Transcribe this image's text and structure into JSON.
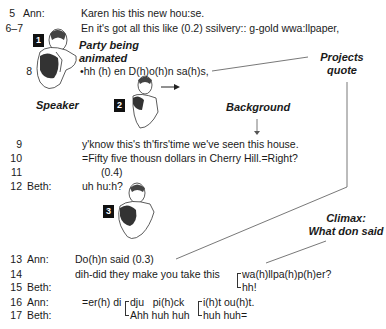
{
  "transcript": {
    "lines": [
      {
        "num": "5",
        "speaker": "Ann:",
        "text": "Karen his this new hou:se."
      },
      {
        "num": "6–7",
        "speaker": "",
        "text": "En it's got all this like (0.2) ssilvery:: g-gold wwa:llpaper,"
      },
      {
        "num": "8",
        "speaker": "",
        "text": "•hh (h) en D(h)o(h)n sa(h)s,"
      },
      {
        "num": "9",
        "speaker": "",
        "text": "y'know this's th'firs'time we've seen this house."
      },
      {
        "num": "10",
        "speaker": "",
        "text": "=Fifty five thousn dollars in Cherry Hill.=Right?"
      },
      {
        "num": "11",
        "speaker": "",
        "text": "(0.4)"
      },
      {
        "num": "12",
        "speaker": "Beth:",
        "text": "uh hu:h?"
      },
      {
        "num": "13",
        "speaker": "Ann:",
        "text": "Do(h)n said (0.3)"
      },
      {
        "num": "14",
        "speaker": "",
        "text": "dih-did they make you take this",
        "overlap": "wa(h)llpa(h)p(h)er?"
      },
      {
        "num": "15",
        "speaker": "Beth:",
        "text": "",
        "overlap": "hh!"
      },
      {
        "num": "16",
        "speaker": "Ann:",
        "text": "=er(h) di",
        "overlap1": "dju   pi(h)ck",
        "overlap2": "i(h)t ou(h)t."
      },
      {
        "num": "17",
        "speaker": "Beth:",
        "text": "",
        "overlap1": "Ahh huh huh",
        "overlap2": "huh huh="
      }
    ]
  },
  "annotations": {
    "party_animated": "Party being\nanimated",
    "party_line1": "Party being",
    "party_line2": "animated",
    "speaker": "Speaker",
    "projects_line1": "Projects",
    "projects_line2": "quote",
    "background": "Background",
    "climax_line1": "Climax:",
    "climax_line2": "What don said"
  },
  "badges": [
    "1",
    "2",
    "3"
  ],
  "figures": [
    "speaker-figure-1",
    "speaker-figure-2",
    "speaker-figure-3"
  ]
}
